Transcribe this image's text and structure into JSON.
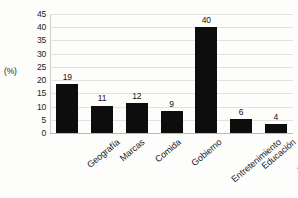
{
  "chart_data": {
    "type": "bar",
    "title": "",
    "subtitle": "",
    "xlabel": "",
    "ylabel": "(%)",
    "ylim": [
      0,
      45
    ],
    "ytick_step": 5,
    "yticks": [
      45,
      40,
      35,
      30,
      25,
      20,
      15,
      10,
      5,
      0
    ],
    "grid": true,
    "legend": false,
    "categories": [
      "Geografía",
      "Marcas",
      "Comida",
      "Gobierno",
      "Entretenimiento",
      "Educación",
      "Transportes"
    ],
    "values": [
      19,
      11,
      12,
      9,
      40,
      6,
      4
    ],
    "value_labels": [
      "19",
      "11",
      "12",
      "9",
      "40",
      "6",
      "4"
    ],
    "bar_color": "#0d0d0d",
    "gridline_color": "#e2e2e0",
    "background_color": "#fdfdfc"
  }
}
